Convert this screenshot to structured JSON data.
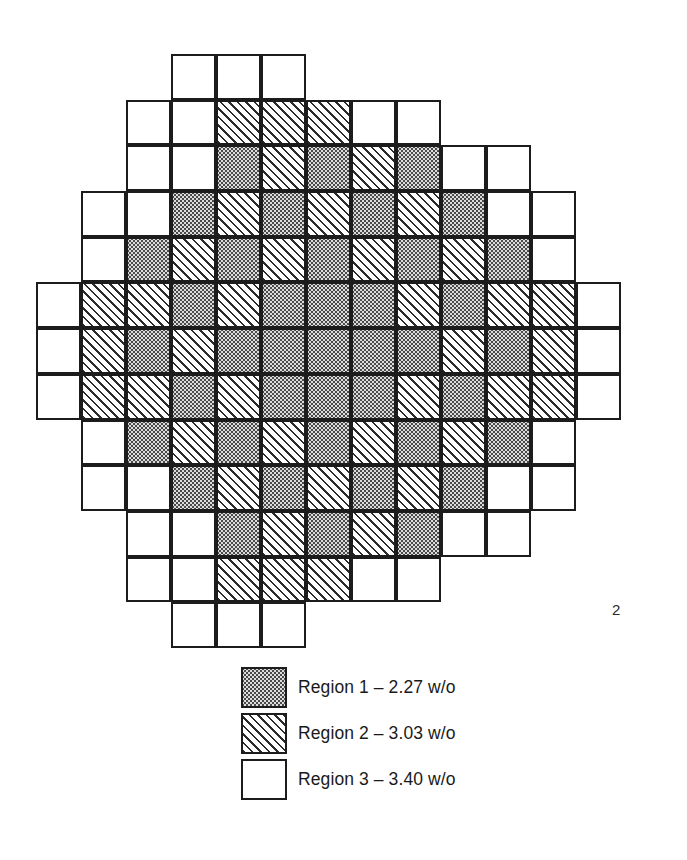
{
  "figure": {
    "kind": "reactor-core-loading-map",
    "page_number": "2",
    "grid": {
      "columns": 13,
      "rows": 13,
      "cell_size_px": 45
    },
    "region_codes": {
      "1": "reg-1",
      "2": "reg-2",
      "3": "reg-3",
      "0": null
    },
    "comment": "0 = no assembly at this lattice position (outside octagon); 1/2/3 = region number",
    "rows": [
      [
        0,
        0,
        0,
        3,
        3,
        3,
        0,
        0,
        0,
        0,
        0,
        0,
        0
      ],
      [
        0,
        0,
        3,
        3,
        2,
        2,
        2,
        3,
        3,
        0,
        0,
        0,
        0
      ],
      [
        0,
        0,
        3,
        3,
        1,
        2,
        1,
        2,
        1,
        3,
        3,
        0,
        0
      ],
      [
        0,
        3,
        3,
        1,
        2,
        1,
        2,
        1,
        2,
        1,
        3,
        3,
        0
      ],
      [
        0,
        3,
        1,
        2,
        1,
        2,
        1,
        2,
        1,
        2,
        1,
        3,
        0
      ],
      [
        3,
        2,
        2,
        1,
        2,
        1,
        1,
        1,
        2,
        1,
        2,
        2,
        3
      ],
      [
        3,
        2,
        1,
        2,
        1,
        1,
        1,
        1,
        1,
        2,
        1,
        2,
        3
      ],
      [
        3,
        2,
        2,
        1,
        2,
        1,
        1,
        1,
        2,
        1,
        2,
        2,
        3
      ],
      [
        0,
        3,
        1,
        2,
        1,
        2,
        1,
        2,
        1,
        2,
        1,
        3,
        0
      ],
      [
        0,
        3,
        3,
        1,
        2,
        1,
        2,
        1,
        2,
        1,
        3,
        3,
        0
      ],
      [
        0,
        0,
        3,
        3,
        1,
        2,
        1,
        2,
        1,
        3,
        3,
        0,
        0
      ],
      [
        0,
        0,
        3,
        3,
        2,
        2,
        2,
        3,
        3,
        0,
        0,
        0,
        0
      ],
      [
        0,
        0,
        0,
        3,
        3,
        3,
        0,
        0,
        0,
        0,
        0,
        0,
        0
      ]
    ],
    "row_offsets": [
      {
        "row": 0,
        "start_col": 5,
        "count": 3
      },
      {
        "row": 1,
        "start_col": 3,
        "count": 7
      },
      {
        "row": 2,
        "start_col": 2,
        "count": 9
      },
      {
        "row": 3,
        "start_col": 1,
        "count": 11
      },
      {
        "row": 4,
        "start_col": 1,
        "count": 11
      },
      {
        "row": 5,
        "start_col": 0,
        "count": 13
      },
      {
        "row": 6,
        "start_col": 0,
        "count": 13
      },
      {
        "row": 7,
        "start_col": 0,
        "count": 13
      },
      {
        "row": 8,
        "start_col": 1,
        "count": 11
      },
      {
        "row": 9,
        "start_col": 1,
        "count": 11
      },
      {
        "row": 10,
        "start_col": 2,
        "count": 9
      },
      {
        "row": 11,
        "start_col": 3,
        "count": 7
      },
      {
        "row": 12,
        "start_col": 5,
        "count": 3
      }
    ],
    "pattern": [
      [
        3,
        3,
        3
      ],
      [
        3,
        3,
        2,
        2,
        2,
        3,
        3
      ],
      [
        3,
        3,
        1,
        2,
        1,
        2,
        1,
        3,
        3
      ],
      [
        3,
        3,
        1,
        2,
        1,
        2,
        1,
        2,
        1,
        3,
        3
      ],
      [
        3,
        1,
        2,
        1,
        2,
        1,
        2,
        1,
        2,
        1,
        3
      ],
      [
        3,
        2,
        2,
        1,
        2,
        1,
        1,
        1,
        2,
        1,
        2,
        2,
        3
      ],
      [
        3,
        2,
        1,
        2,
        1,
        1,
        1,
        1,
        1,
        2,
        1,
        2,
        3
      ],
      [
        3,
        2,
        2,
        1,
        2,
        1,
        1,
        1,
        2,
        1,
        2,
        2,
        3
      ],
      [
        3,
        1,
        2,
        1,
        2,
        1,
        2,
        1,
        2,
        1,
        3
      ],
      [
        3,
        3,
        1,
        2,
        1,
        2,
        1,
        2,
        1,
        3,
        3
      ],
      [
        3,
        3,
        1,
        2,
        1,
        2,
        1,
        3,
        3
      ],
      [
        3,
        3,
        2,
        2,
        2,
        3,
        3
      ],
      [
        3,
        3,
        3
      ]
    ]
  },
  "legend": {
    "items": [
      {
        "swatch_class": "reg-1",
        "label": "Region 1 – 2.27 w/o",
        "region": "Region 1",
        "enrichment": "2.27 w/o"
      },
      {
        "swatch_class": "reg-2",
        "label": "Region 2 – 3.03 w/o",
        "region": "Region 2",
        "enrichment": "3.03 w/o"
      },
      {
        "swatch_class": "reg-3",
        "label": "Region 3 – 3.40 w/o",
        "region": "Region 3",
        "enrichment": "3.40 w/o"
      }
    ]
  },
  "colors": {
    "line": "#1c1c1c",
    "region1_fill": "#dcdcdc",
    "region2_hatch": "#2b2b2b",
    "region3_fill": "#ffffff",
    "background": "#ffffff"
  }
}
